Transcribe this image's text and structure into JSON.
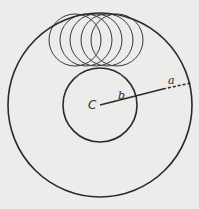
{
  "diagram": {
    "background_color": "#ececea",
    "stroke_color": "#2a2a2a",
    "outer_circle": {
      "cx": 100,
      "cy": 105,
      "r": 92,
      "stroke_width": 1.6
    },
    "inner_circle": {
      "cx": 100,
      "cy": 105,
      "r": 37,
      "stroke_width": 1.6
    },
    "small_circles": [
      {
        "cx": 75,
        "cy": 40,
        "r": 26
      },
      {
        "cx": 86,
        "cy": 40,
        "r": 26
      },
      {
        "cx": 96,
        "cy": 40,
        "r": 26
      },
      {
        "cx": 107,
        "cy": 40,
        "r": 26
      },
      {
        "cx": 117,
        "cy": 40,
        "r": 26
      }
    ],
    "radius_line": {
      "solid": {
        "x1": 100,
        "y1": 105,
        "x2": 163,
        "y2": 89
      },
      "dashed": {
        "x1": 163,
        "y1": 89,
        "x2": 191,
        "y2": 83
      }
    },
    "labels": {
      "center": {
        "text": "C",
        "x": 88,
        "y": 109
      },
      "b": {
        "text": "b",
        "x": 118,
        "y": 99
      },
      "a": {
        "text": "a",
        "x": 168,
        "y": 84
      }
    }
  }
}
